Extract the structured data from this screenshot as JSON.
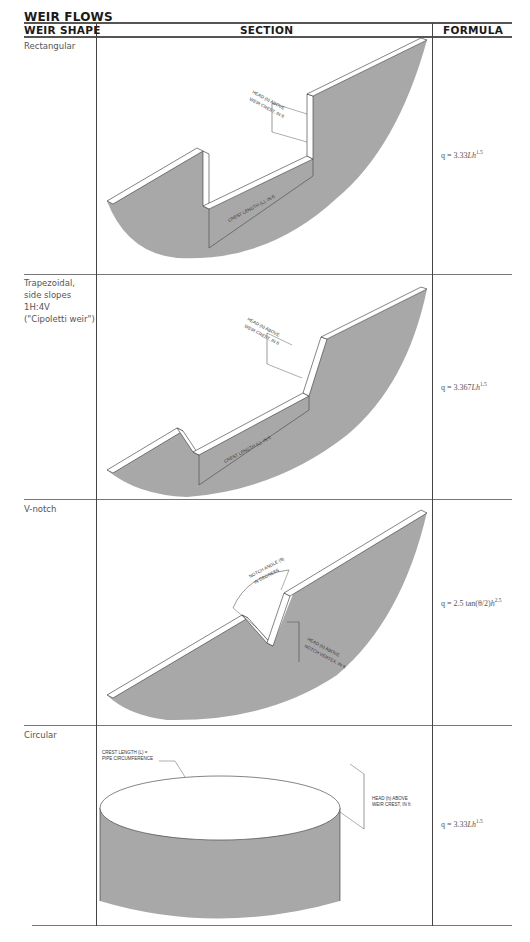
{
  "title": "WEIR FLOWS",
  "headers": {
    "shape": "WEIR SHAPE",
    "section": "SECTION",
    "formula": "FORMULA"
  },
  "rows": [
    {
      "shape": "Rectangular",
      "formula_prefix": "q = 3.33",
      "formula_var": "Lh",
      "formula_exp": "1.5",
      "labels": {
        "head": "HEAD (h) ABOVE",
        "head2": "WEIR CREST, IN ft",
        "crest": "CREST LENGTH (L), IN ft"
      }
    },
    {
      "shape": "Trapezoidal,\nside slopes\n1H:4V\n(\"Cipoletti weir\")",
      "formula_prefix": "q = 3.367",
      "formula_var": "Lh",
      "formula_exp": "1.5",
      "labels": {
        "head": "HEAD (h) ABOVE",
        "head2": "WEIR CREST, IN ft",
        "crest": "CREST LENGTH (L), IN ft"
      }
    },
    {
      "shape": "V-notch",
      "formula_prefix": "q = 2.5 tan(θ/2)",
      "formula_var": "h",
      "formula_exp": "2.5",
      "labels": {
        "angle": "NOTCH ANGLE (θ)",
        "angle2": "IN DEGREES",
        "head": "HEAD (h) ABOVE",
        "head2": "NOTCH VERTEX, IN ft"
      }
    },
    {
      "shape": "Circular",
      "formula_prefix": "q = 3.33",
      "formula_var": "Lh",
      "formula_exp": "1.5",
      "labels": {
        "crest": "CREST LENGTH (L) =",
        "crest2": "PIPE CIRCUMFERENCE",
        "head": "HEAD (h) ABOVE",
        "head2": "WEIR CREST, IN ft"
      }
    }
  ],
  "colors": {
    "fill": "#a8a8a8",
    "line": "#333333",
    "rule": "#777777"
  }
}
